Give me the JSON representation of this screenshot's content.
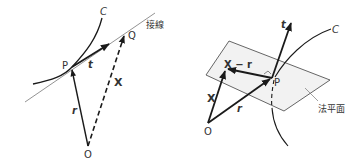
{
  "left_figure": {
    "curve_label": "C",
    "tangent_label": "接線",
    "point_p": "P",
    "point_q": "Q",
    "origin": "O",
    "vector_t": "t",
    "vector_r": "r",
    "vector_x": "X"
  },
  "right_figure": {
    "curve_label": "C",
    "plane_label": "法平面",
    "point_p": "P",
    "origin": "O",
    "vector_t": "t",
    "vector_r": "r",
    "vector_x": "X",
    "vector_x_minus_r": "X − r"
  },
  "colors": {
    "line": "#1a1a1a",
    "thin_line": "#777777",
    "plane_fill": "#f2f2f2",
    "text": "#333333"
  }
}
